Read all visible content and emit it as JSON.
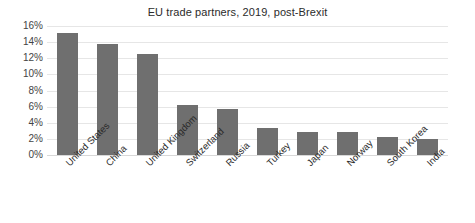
{
  "chart_data": {
    "type": "bar",
    "title": "EU trade partners, 2019, post-Brexit",
    "xlabel": "",
    "ylabel": "",
    "categories": [
      "United States",
      "China",
      "United Kingdom",
      "Switzerland",
      "Russia",
      "Turkey",
      "Japan",
      "Norway",
      "South Korea",
      "India"
    ],
    "values": [
      15.1,
      13.8,
      12.5,
      6.2,
      5.7,
      3.3,
      2.8,
      2.8,
      2.2,
      2.0
    ],
    "value_unit": "percent",
    "ylim": [
      0,
      16
    ],
    "ytick_values": [
      0,
      2,
      4,
      6,
      8,
      10,
      12,
      14,
      16
    ],
    "ytick_labels": [
      "0%",
      "2%",
      "4%",
      "6%",
      "8%",
      "10%",
      "12%",
      "14%",
      "16%"
    ],
    "grid": true,
    "legend": false,
    "legend_position": "none",
    "bar_color": "#6f6f6f",
    "gridline_color": "#e6e6e6",
    "background_color": "#ffffff",
    "xtick_rotation_deg": -45
  }
}
